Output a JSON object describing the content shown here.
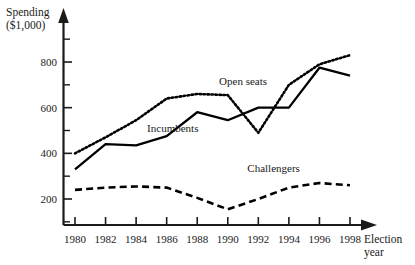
{
  "chart_data": {
    "type": "line",
    "title": "",
    "ylabel": "Spending ($1,000)",
    "ylabel_line1": "Spending",
    "ylabel_line2": "($1,000)",
    "xlabel": "Election year",
    "xlabel_line1": "Election",
    "xlabel_line2": "year",
    "grid": false,
    "legend_position": "inline-annotations",
    "x": [
      1980,
      1982,
      1984,
      1986,
      1988,
      1990,
      1992,
      1994,
      1996,
      1998
    ],
    "xticklabels": [
      "1980",
      "1982",
      "1984",
      "1986",
      "1988",
      "1990",
      "1992",
      "1994",
      "1996",
      "1998"
    ],
    "yticks": [
      200,
      400,
      600,
      800
    ],
    "yticklabels": [
      "200",
      "400",
      "600",
      "800"
    ],
    "ylim": [
      0,
      900
    ],
    "xlim": [
      1979,
      1999
    ],
    "minor_yticks": [
      100,
      300,
      500,
      700,
      900
    ],
    "series": [
      {
        "name": "Open seats",
        "style": "dotted",
        "color": "#000000",
        "values": [
          400,
          470,
          545,
          640,
          660,
          655,
          490,
          700,
          790,
          830
        ]
      },
      {
        "name": "Incumbents",
        "style": "solid",
        "color": "#000000",
        "values": [
          330,
          440,
          435,
          475,
          580,
          545,
          600,
          600,
          775,
          740
        ]
      },
      {
        "name": "Challengers",
        "style": "dashed",
        "color": "#000000",
        "values": [
          240,
          250,
          255,
          250,
          205,
          155,
          200,
          250,
          270,
          260
        ]
      }
    ],
    "annotations": [
      {
        "name": "open-seats-label",
        "text": "Open seats",
        "x": 1991.0,
        "y": 700
      },
      {
        "name": "incumbents-label",
        "text": "Incumbents",
        "x": 1986.4,
        "y": 492
      },
      {
        "name": "challengers-label",
        "text": "Challengers",
        "x": 1993.0,
        "y": 318
      }
    ]
  }
}
